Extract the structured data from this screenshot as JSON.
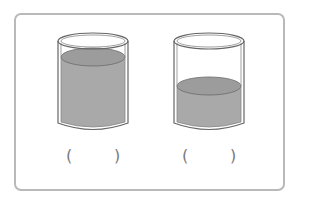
{
  "figure": {
    "colors": {
      "frame": "#b9b9b9",
      "liquid": "#a6a6a6",
      "liquid_top": "#9c9c9c",
      "glass": "#666666"
    },
    "cups": [
      {
        "id": "left",
        "fill_level": "high",
        "answer_blank": {
          "open": "(",
          "close": ")"
        }
      },
      {
        "id": "right",
        "fill_level": "low",
        "answer_blank": {
          "open": "(",
          "close": ")"
        }
      }
    ]
  }
}
